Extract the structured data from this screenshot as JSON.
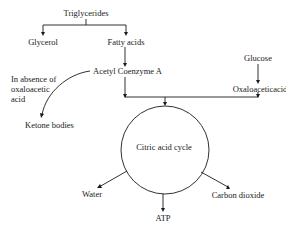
{
  "diagram": {
    "type": "metabolic-pathway",
    "nodes": {
      "triglycerides": "Triglycerides",
      "glycerol": "Glycerol",
      "fatty_acids": "Fatty acids",
      "acetyl_coa": "Acetyl Coenzyme A",
      "glucose": "Glucose",
      "oxaloacetic_acid": "Oxaloaceticacid",
      "absence_note": "In absence of oxaloacetic acid",
      "ketone_bodies": "Ketone bodies",
      "citric_acid_cycle": "Citric acid cycle",
      "water": "Water",
      "atp": "ATP",
      "carbon_dioxide": "Carbon dioxide"
    },
    "edges": [
      {
        "from": "Triglycerides",
        "to": "Glycerol"
      },
      {
        "from": "Triglycerides",
        "to": "Fatty acids"
      },
      {
        "from": "Fatty acids",
        "to": "Acetyl Coenzyme A"
      },
      {
        "from": "Acetyl Coenzyme A",
        "to": "Ketone bodies",
        "condition": "In absence of oxaloacetic acid"
      },
      {
        "from": "Glucose",
        "to": "Oxaloaceticacid"
      },
      {
        "from": "Acetyl Coenzyme A",
        "to": "Citric acid cycle"
      },
      {
        "from": "Oxaloaceticacid",
        "to": "Citric acid cycle"
      },
      {
        "from": "Citric acid cycle",
        "to": "Water"
      },
      {
        "from": "Citric acid cycle",
        "to": "ATP"
      },
      {
        "from": "Citric acid cycle",
        "to": "Carbon dioxide"
      }
    ]
  }
}
